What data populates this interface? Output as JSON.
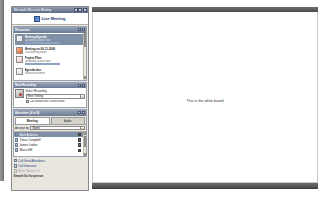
{
  "window": {
    "title": "Microsoft Office Live Meeting",
    "buttons": [
      "minimize-button",
      "maximize-button",
      "close-button"
    ],
    "brand": "Live Meeting",
    "brand_icon": "live-meeting-logo-icon"
  },
  "whiteboard": {
    "text": "This is the white board"
  },
  "resources_panel": {
    "title": "Resources",
    "items": [
      {
        "title": "Meeting Agenda",
        "subtitle": "Uploading, please wait",
        "icon": "document-icon",
        "selected": true,
        "progress": true
      },
      {
        "title": "Meeting on 06-11-2006",
        "subtitle": "Last Meeting Notes",
        "icon": "powerpoint-icon",
        "selected": false,
        "progress": false
      },
      {
        "title": "Project Plan",
        "subtitle": "Uploading, please wait",
        "icon": "pdf-icon",
        "selected": false,
        "progress": true
      },
      {
        "title": "Agenda.doc",
        "subtitle": "Shared document",
        "icon": "whiteboard-icon",
        "selected": false,
        "progress": false
      }
    ]
  },
  "recording_panel": {
    "title": "New Recording",
    "icon": "record-icon",
    "field_label": "Select Recording",
    "field_value": "New Testing",
    "checkbox_label": "Call rooted over current dialin",
    "checkbox_checked": false
  },
  "attendees_panel": {
    "title": "Attendees (4 of 4)",
    "tabs": [
      {
        "label": "Meeting",
        "active": true
      },
      {
        "label": "Audio",
        "active": false
      }
    ],
    "filter_label": "Arrange by:",
    "filter_value": "Name",
    "rows": [
      {
        "name": "Mark Andrews",
        "selected": true,
        "icon": "attendee-icon"
      },
      {
        "name": "Trevor Campbell",
        "selected": false,
        "icon": "attendee-icon"
      },
      {
        "name": "James Linden",
        "selected": false,
        "icon": "attendee-icon"
      },
      {
        "name": "Marco Hill",
        "selected": false,
        "icon": "attendee-icon"
      }
    ]
  },
  "actions": {
    "items": [
      {
        "label": "Call Send Attendees...",
        "icon": "invite-icon",
        "disabled": false
      },
      {
        "label": "Call Someone",
        "icon": "phone-icon",
        "disabled": false
      },
      {
        "label": "More Options >>",
        "icon": "options-icon",
        "disabled": true
      }
    ],
    "search_legend": "Search list for person"
  }
}
